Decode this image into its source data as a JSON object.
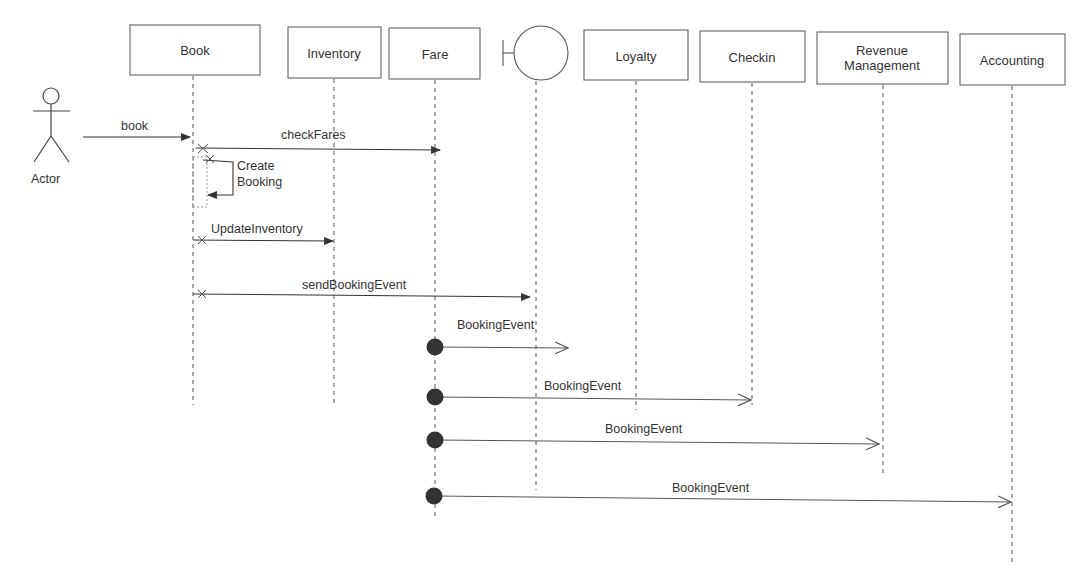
{
  "diagram": {
    "type": "sequence",
    "actor": {
      "label": "Actor"
    },
    "participants": [
      {
        "id": "book",
        "label": "Book",
        "kind": "box"
      },
      {
        "id": "inventory",
        "label": "Inventory",
        "kind": "box"
      },
      {
        "id": "fare",
        "label": "Fare",
        "kind": "box"
      },
      {
        "id": "boundary",
        "label": "",
        "kind": "boundary"
      },
      {
        "id": "loyalty",
        "label": "Loyalty",
        "kind": "box"
      },
      {
        "id": "checkin",
        "label": "Checkin",
        "kind": "box"
      },
      {
        "id": "revenue",
        "label_line1": "Revenue",
        "label_line2": "Management",
        "kind": "box"
      },
      {
        "id": "accounting",
        "label": "Accounting",
        "kind": "box"
      }
    ],
    "messages": [
      {
        "from": "actor",
        "to": "book",
        "label": "book",
        "style": "sync"
      },
      {
        "from": "book",
        "to": "boundary",
        "label": "checkFares",
        "style": "sync"
      },
      {
        "from": "book",
        "to": "book",
        "label_line1": "Create",
        "label_line2": "Booking",
        "style": "self"
      },
      {
        "from": "book",
        "to": "fare",
        "label": "UpdateInventory",
        "style": "sync"
      },
      {
        "from": "book",
        "to": "boundary-side",
        "label": "sendBookingEvent",
        "style": "sync"
      },
      {
        "from": "fare",
        "to": "between-boundary-loyalty",
        "label": "BookingEvent",
        "style": "async"
      },
      {
        "from": "fare",
        "to": "checkin",
        "label": "BookingEvent",
        "style": "async"
      },
      {
        "from": "fare",
        "to": "revenue",
        "label": "BookingEvent",
        "style": "async"
      },
      {
        "from": "fare",
        "to": "accounting",
        "label": "BookingEvent",
        "style": "async"
      }
    ],
    "colors": {
      "line": "#444444",
      "box_border": "#555555",
      "found_dot": "#333333",
      "bg": "#ffffff"
    }
  }
}
